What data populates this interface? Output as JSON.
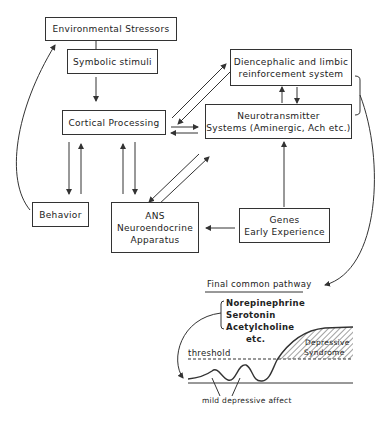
{
  "boxes": {
    "environmental_stressors": "Environmental Stressors",
    "symbolic_stimuli": "Symbolic stimuli",
    "cortical_processing": "Cortical Processing",
    "diencephalic_line1": "Diencephalic and limbic",
    "diencephalic_line2": "reinforcement system",
    "neurotransmitter_line1": "Neurotransmitter",
    "neurotransmitter_line2": "Systems (Aminergic, Ach etc.)",
    "behavior": "Behavior",
    "ans_line1": "ANS",
    "ans_line2": "Neuroendocrine",
    "ans_line3": "Apparatus",
    "genes_line1": "Genes",
    "genes_line2": "Early Experience"
  },
  "pathway": {
    "title": "Final common pathway",
    "transmitters": [
      "Norepinephrine",
      "Serotonin",
      "Acetylcholine",
      "etc."
    ],
    "threshold_label": "threshold",
    "syndrome_line1": "Depressive",
    "syndrome_line2": "Syndrome",
    "affect_label": "mild depressive affect"
  },
  "colors": {
    "line": "#333333",
    "background": "#ffffff"
  }
}
